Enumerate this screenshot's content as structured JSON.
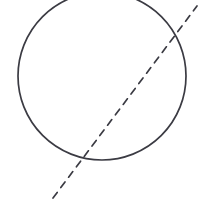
{
  "canvas": {
    "width": 205,
    "height": 210,
    "background_color": "#ffffff",
    "title": "Circle with dashed secant line"
  },
  "figure": {
    "style": "hand-drawn geometric line diagram",
    "ink_color": "#3b3b43",
    "elements": [
      {
        "name": "circle",
        "shape": "circle",
        "center_x": 102,
        "center_y": 76,
        "radius": 84,
        "stroke_color": "#3b3b43",
        "stroke_width": 1.7,
        "line_style": "solid",
        "clipped_edges": "top",
        "notes": "top of circle extends above the top edge of the image"
      },
      {
        "name": "secant-line",
        "shape": "line",
        "x1": 53,
        "y1": 198,
        "x2": 197,
        "y2": 6,
        "stroke_color": "#3b3b43",
        "stroke_width": 1.7,
        "line_style": "dashed",
        "dash_length": 7,
        "dash_gap": 6,
        "notes": "dashed line crosses the circle near the bottom-left arc and again near the upper-right arc"
      }
    ],
    "intersections": [
      {
        "name": "lower-intersection",
        "x": 91,
        "y": 157
      },
      {
        "name": "upper-intersection",
        "x": 183,
        "y": 25
      }
    ]
  },
  "labels": []
}
